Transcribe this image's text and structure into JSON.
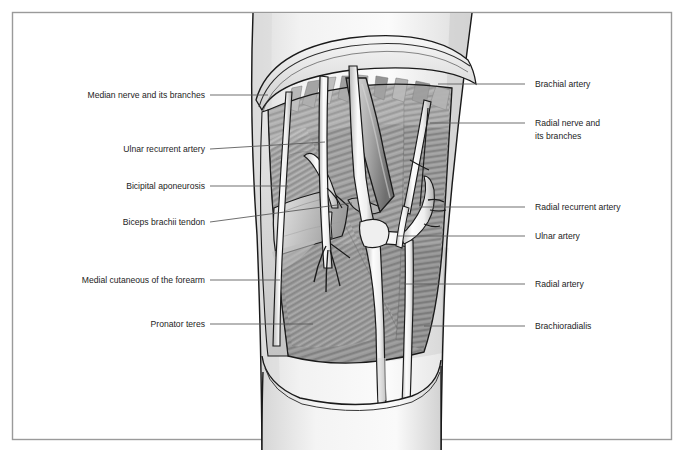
{
  "figure": {
    "border_color": "#9a9a9a",
    "background_color": "#ffffff",
    "skin_color": "#ededed",
    "muscle_color": "#9d9d9d",
    "vessel_color": "#f2f2f2",
    "outline_color": "#1a1a1a",
    "leader_color": "#555555",
    "label_color": "#1d1d1d"
  },
  "labels_left": [
    {
      "id": "median-nerve",
      "text": "Median nerve and its branches",
      "text_x": 205,
      "text_y": 98,
      "lead_x1": 210,
      "lead_y1": 95,
      "lead_x2": 268,
      "lead_y2": 95
    },
    {
      "id": "ulnar-recurrent",
      "text": "Ulnar recurrent artery",
      "text_x": 205,
      "text_y": 152,
      "lead_x1": 210,
      "lead_y1": 149,
      "lead_x2": 325,
      "lead_y2": 142
    },
    {
      "id": "bicipital-aponeurosis",
      "text": "Bicipital aponeurosis",
      "text_x": 205,
      "text_y": 189,
      "lead_x1": 210,
      "lead_y1": 186,
      "lead_x2": 288,
      "lead_y2": 186
    },
    {
      "id": "biceps-tendon",
      "text": "Biceps brachii tendon",
      "text_x": 205,
      "text_y": 225,
      "lead_x1": 210,
      "lead_y1": 222,
      "lead_x2": 352,
      "lead_y2": 203
    },
    {
      "id": "medial-cutaneous",
      "text": "Medial cutaneous of the forearm",
      "text_x": 205,
      "text_y": 283,
      "lead_x1": 210,
      "lead_y1": 280,
      "lead_x2": 280,
      "lead_y2": 280
    },
    {
      "id": "pronator-teres",
      "text": "Pronator teres",
      "text_x": 205,
      "text_y": 327,
      "lead_x1": 210,
      "lead_y1": 324,
      "lead_x2": 313,
      "lead_y2": 324
    }
  ],
  "labels_right": [
    {
      "id": "brachial-artery",
      "lines": [
        "Brachial artery"
      ],
      "text_x": 535,
      "text_y": 87,
      "lead_x1": 525,
      "lead_y1": 84,
      "lead_x2": 438,
      "lead_y2": 84
    },
    {
      "id": "radial-nerve",
      "lines": [
        "Radial nerve and",
        "its branches"
      ],
      "text_x": 535,
      "text_y": 126,
      "lead_x1": 525,
      "lead_y1": 123,
      "lead_x2": 430,
      "lead_y2": 123
    },
    {
      "id": "radial-recurrent",
      "lines": [
        "Radial recurrent artery"
      ],
      "text_x": 535,
      "text_y": 210,
      "lead_x1": 525,
      "lead_y1": 207,
      "lead_x2": 419,
      "lead_y2": 207
    },
    {
      "id": "ulnar-artery",
      "lines": [
        "Ulnar artery"
      ],
      "text_x": 535,
      "text_y": 239,
      "lead_x1": 525,
      "lead_y1": 236,
      "lead_x2": 398,
      "lead_y2": 236
    },
    {
      "id": "radial-artery",
      "lines": [
        "Radial artery"
      ],
      "text_x": 535,
      "text_y": 287,
      "lead_x1": 525,
      "lead_y1": 284,
      "lead_x2": 404,
      "lead_y2": 284
    },
    {
      "id": "brachioradialis",
      "lines": [
        "Brachioradialis"
      ],
      "text_x": 535,
      "text_y": 329,
      "lead_x1": 525,
      "lead_y1": 326,
      "lead_x2": 424,
      "lead_y2": 326
    }
  ]
}
